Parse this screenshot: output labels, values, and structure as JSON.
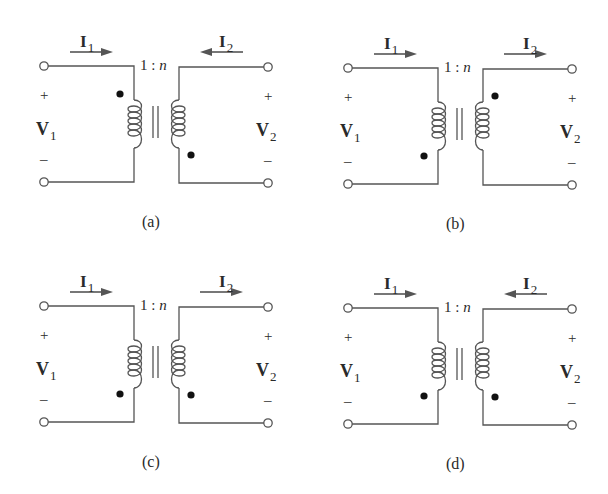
{
  "figure": {
    "panels": [
      {
        "id": "a",
        "caption": "(a)",
        "ratio": {
          "left": "1 : ",
          "right": "n"
        },
        "i1": {
          "symbol": "I",
          "sub": "1",
          "direction": "right"
        },
        "i2": {
          "symbol": "I",
          "sub": "2",
          "direction": "left"
        },
        "v1": {
          "symbol": "V",
          "sub": "1",
          "plus": "+",
          "minus": "–"
        },
        "v2": {
          "symbol": "V",
          "sub": "2",
          "plus": "+",
          "minus": "–"
        },
        "dots": {
          "primary": "top",
          "secondary": "bottom"
        }
      },
      {
        "id": "b",
        "caption": "(b)",
        "ratio": {
          "left": "1 : ",
          "right": "n"
        },
        "i1": {
          "symbol": "I",
          "sub": "1",
          "direction": "right"
        },
        "i2": {
          "symbol": "I",
          "sub": "2",
          "direction": "right"
        },
        "v1": {
          "symbol": "V",
          "sub": "1",
          "plus": "+",
          "minus": "–"
        },
        "v2": {
          "symbol": "V",
          "sub": "2",
          "plus": "+",
          "minus": "–"
        },
        "dots": {
          "primary": "bottom",
          "secondary": "top"
        }
      },
      {
        "id": "c",
        "caption": "(c)",
        "ratio": {
          "left": "1 : ",
          "right": "n"
        },
        "i1": {
          "symbol": "I",
          "sub": "1",
          "direction": "right"
        },
        "i2": {
          "symbol": "I",
          "sub": "2",
          "direction": "right"
        },
        "v1": {
          "symbol": "V",
          "sub": "1",
          "plus": "+",
          "minus": "–"
        },
        "v2": {
          "symbol": "V",
          "sub": "2",
          "plus": "+",
          "minus": "–"
        },
        "dots": {
          "primary": "bottom",
          "secondary": "bottom"
        }
      },
      {
        "id": "d",
        "caption": "(d)",
        "ratio": {
          "left": "1 : ",
          "right": "n"
        },
        "i1": {
          "symbol": "I",
          "sub": "1",
          "direction": "right"
        },
        "i2": {
          "symbol": "I",
          "sub": "2",
          "direction": "left"
        },
        "v1": {
          "symbol": "V",
          "sub": "1",
          "plus": "+",
          "minus": "–"
        },
        "v2": {
          "symbol": "V",
          "sub": "2",
          "plus": "+",
          "minus": "–"
        },
        "dots": {
          "primary": "bottom",
          "secondary": "bottom"
        }
      }
    ],
    "colors": {
      "wire": "#555555",
      "text": "#2a2a2a",
      "arrow": "#555555"
    }
  }
}
